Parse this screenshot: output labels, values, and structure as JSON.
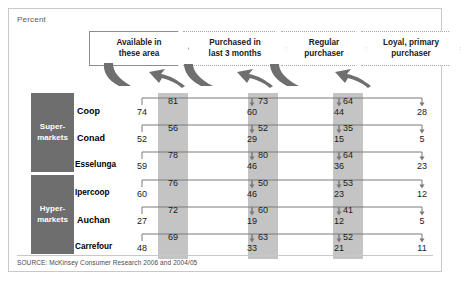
{
  "exhibit": {
    "unit_label": "Percent",
    "source": "SOURCE: McKinsey Consumer Research 2006 and 2004/05"
  },
  "colors": {
    "band_grey": "#c4c4c4",
    "group_block_grey": "#6e6e6e",
    "line_grey": "#7a7a7a",
    "border_grey": "#c8c8c8",
    "text_dark": "#1a1a1a"
  },
  "stages": [
    {
      "label": "Available in\nthese area",
      "style": "solid"
    },
    {
      "label": "Purchased in\nlast 3 months",
      "style": "dotted"
    },
    {
      "label": "Regular\npurchaser",
      "style": "dotted"
    },
    {
      "label": "Loyal, primary\npurchaser",
      "style": "dotted"
    }
  ],
  "groups": [
    {
      "label": "Super-\nmarkets",
      "row_count": 3
    },
    {
      "label": "Hyper-\nmarkets",
      "row_count": 3
    }
  ],
  "rows": [
    {
      "brand": "Coop",
      "group": "Super-markets",
      "endpoints": [
        74,
        60,
        44,
        28
      ],
      "conversions": [
        81,
        73,
        64
      ]
    },
    {
      "brand": "Conad",
      "group": "Super-markets",
      "endpoints": [
        52,
        29,
        15,
        5
      ],
      "conversions": [
        56,
        52,
        35
      ]
    },
    {
      "brand": "Esselunga",
      "group": "Super-markets",
      "endpoints": [
        59,
        46,
        36,
        23
      ],
      "conversions": [
        78,
        80,
        64
      ]
    },
    {
      "brand": "Ipercoop",
      "group": "Hyper-markets",
      "endpoints": [
        60,
        46,
        23,
        12
      ],
      "conversions": [
        76,
        50,
        53
      ]
    },
    {
      "brand": "Auchan",
      "group": "Hyper-markets",
      "endpoints": [
        27,
        19,
        12,
        5
      ],
      "conversions": [
        72,
        60,
        41
      ]
    },
    {
      "brand": "Carrefour",
      "group": "Hyper-markets",
      "endpoints": [
        48,
        33,
        21,
        11
      ],
      "conversions": [
        69,
        63,
        52
      ]
    }
  ],
  "chart_data": {
    "type": "table",
    "title": "Percent",
    "subtitle": "Grocery retail customer conversion funnel by banner",
    "xlabel": "",
    "ylabel": "",
    "grid": false,
    "legend_position": "none",
    "stage_labels": [
      "Available in these area",
      "Purchased in last 3 months",
      "Regular purchaser",
      "Loyal, primary purchaser"
    ],
    "categories": [
      "Coop",
      "Conad",
      "Esselunga",
      "Ipercoop",
      "Auchan",
      "Carrefour"
    ],
    "series": [
      {
        "name": "Available in these area",
        "values": [
          74,
          52,
          59,
          60,
          27,
          48
        ]
      },
      {
        "name": "Purchased in last 3 months",
        "values": [
          60,
          29,
          46,
          46,
          19,
          33
        ]
      },
      {
        "name": "Regular purchaser",
        "values": [
          44,
          15,
          36,
          23,
          12,
          21
        ]
      },
      {
        "name": "Loyal, primary purchaser",
        "values": [
          28,
          5,
          23,
          12,
          5,
          11
        ]
      }
    ],
    "conversion_series": [
      {
        "name": "Available → Purchased",
        "values": [
          81,
          56,
          78,
          76,
          72,
          69
        ]
      },
      {
        "name": "Purchased → Regular",
        "values": [
          73,
          52,
          80,
          50,
          60,
          63
        ]
      },
      {
        "name": "Regular → Loyal",
        "values": [
          64,
          35,
          64,
          53,
          41,
          52
        ]
      }
    ],
    "groups": {
      "Super-markets": [
        "Coop",
        "Conad",
        "Esselunga"
      ],
      "Hyper-markets": [
        "Ipercoop",
        "Auchan",
        "Carrefour"
      ]
    },
    "ylim": [
      0,
      100
    ],
    "source": "SOURCE: McKinsey Consumer Research 2006 and 2004/05"
  }
}
